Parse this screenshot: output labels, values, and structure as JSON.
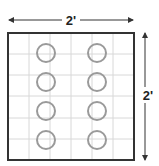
{
  "diagram": {
    "width_label": "2'",
    "height_label": "2'",
    "grid": {
      "cols": 6,
      "rows": 6
    },
    "circles": {
      "columns": 2,
      "rows": 4,
      "count": 8
    },
    "colors": {
      "border": "#333333",
      "grid": "#d8d8d8",
      "circle": "#9a9a9a",
      "arrow": "#333333"
    }
  }
}
